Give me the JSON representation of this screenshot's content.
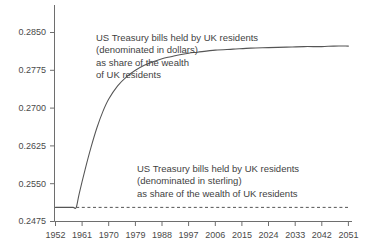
{
  "chart_data": {
    "type": "line",
    "title": "",
    "xlabel": "",
    "ylabel": "",
    "xlim": [
      1952,
      2051
    ],
    "ylim": [
      0.2475,
      0.285
    ],
    "grid": false,
    "legend_position": "none",
    "x_ticks": [
      "1952",
      "1961",
      "1970",
      "1979",
      "1988",
      "1997",
      "2006",
      "2015",
      "2024",
      "2033",
      "2042",
      "2051"
    ],
    "y_ticks": [
      "0.2850",
      "0.2775",
      "0.2700",
      "0.2625",
      "0.2550",
      "0.2475"
    ],
    "series": [
      {
        "name": "US Treasury bills held by UK residents (denominated in dollars) as share of the wealth of UK residents",
        "style": "solid",
        "color": "#555555",
        "x": [
          1952,
          1954,
          1956,
          1958,
          1959,
          1960,
          1962,
          1964,
          1966,
          1968,
          1970,
          1973,
          1976,
          1979,
          1982,
          1985,
          1988,
          1991,
          1994,
          1997,
          2000,
          2006,
          2012,
          2018,
          2024,
          2030,
          2036,
          2042,
          2046,
          2051
        ],
        "y": [
          0.2503,
          0.2503,
          0.2503,
          0.2503,
          0.2503,
          0.253,
          0.2578,
          0.2622,
          0.2661,
          0.2693,
          0.2718,
          0.2744,
          0.2762,
          0.2775,
          0.2785,
          0.2792,
          0.2798,
          0.2802,
          0.2806,
          0.2809,
          0.2811,
          0.2815,
          0.2817,
          0.2819,
          0.282,
          0.2821,
          0.2822,
          0.2822,
          0.2823,
          0.2823
        ]
      },
      {
        "name": "US Treasury bills held by UK residents (denominated in sterling) as share of the wealth of UK residents",
        "style": "dashed",
        "color": "#555555",
        "x": [
          1959,
          2051
        ],
        "y": [
          0.2503,
          0.2503
        ]
      }
    ],
    "annotations": [
      {
        "id": "dollars",
        "lines": [
          "US Treasury bills held by UK residents",
          "(denominated in dollars)",
          "as share of the wealth",
          "of UK residents"
        ]
      },
      {
        "id": "sterling",
        "lines": [
          "US Treasury bills held by UK residents",
          "(denominated in sterling)",
          "as share of the wealth of UK residents"
        ]
      }
    ]
  },
  "axes": {
    "y_tick_labels": [
      {
        "text": "0.2850"
      },
      {
        "text": "0.2775"
      },
      {
        "text": "0.2700"
      },
      {
        "text": "0.2625"
      },
      {
        "text": "0.2550"
      },
      {
        "text": "0.2475"
      }
    ],
    "x_tick_labels": [
      {
        "text": "1952"
      },
      {
        "text": "1961"
      },
      {
        "text": "1970"
      },
      {
        "text": "1979"
      },
      {
        "text": "1988"
      },
      {
        "text": "1997"
      },
      {
        "text": "2006"
      },
      {
        "text": "2015"
      },
      {
        "text": "2024"
      },
      {
        "text": "2033"
      },
      {
        "text": "2042"
      },
      {
        "text": "2051"
      }
    ]
  },
  "annotations": {
    "dollars": {
      "line1": "US Treasury bills held by UK residents",
      "line2": "(denominated in dollars)",
      "line3": "as share of the wealth",
      "line4": "of UK residents"
    },
    "sterling": {
      "line1": "US Treasury bills held by UK residents",
      "line2": "(denominated in sterling)",
      "line3": "as share of the wealth of UK residents"
    }
  },
  "colors": {
    "axis": "#6e6e6e",
    "curve": "#555555",
    "dashed": "#555555",
    "text": "#3f3f3f",
    "background": "#ffffff"
  }
}
